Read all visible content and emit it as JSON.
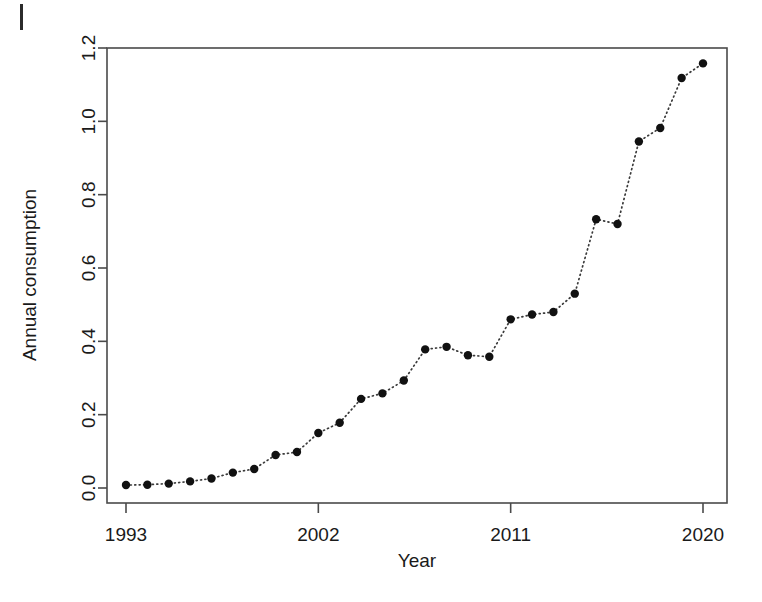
{
  "figure": {
    "background_color": "#ffffff",
    "foreground_color": "#111111",
    "corner_mark": "|"
  },
  "chart_data": {
    "type": "scatter",
    "title": "",
    "xlabel": "Year",
    "ylabel": "Annual consumption",
    "x": [
      1993,
      1994,
      1995,
      1996,
      1997,
      1998,
      1999,
      2000,
      2001,
      2002,
      2003,
      2004,
      2005,
      2006,
      2007,
      2008,
      2009,
      2010,
      2011,
      2012,
      2013,
      2014,
      2015,
      2016,
      2017,
      2018,
      2019,
      2020
    ],
    "values": [
      0.008,
      0.009,
      0.012,
      0.018,
      0.026,
      0.042,
      0.052,
      0.09,
      0.098,
      0.15,
      0.178,
      0.243,
      0.258,
      0.293,
      0.378,
      0.385,
      0.362,
      0.358,
      0.46,
      0.473,
      0.48,
      0.53,
      0.733,
      0.72,
      0.945,
      0.982,
      1.118,
      1.158
    ],
    "xlim": [
      1992.4,
      1920.6
    ],
    "x_range": [
      1992.4,
      2020.6
    ],
    "ylim": [
      -0.04,
      1.24
    ],
    "xticks": [
      1993,
      2002,
      2011,
      2020
    ],
    "xticklabels": [
      "1993",
      "2002",
      "2011",
      "2020"
    ],
    "yticks": [
      0.0,
      0.2,
      0.4,
      0.6,
      0.8,
      1.0,
      1.2
    ],
    "yticklabels": [
      "0.0",
      "0.2",
      "0.4",
      "0.6",
      "0.8",
      "1.0",
      "1.2"
    ],
    "grid": false,
    "legend": null,
    "line_style": "dotted",
    "marker": "filled-circle",
    "marker_color": "#111111",
    "line_color": "#3a3a3a"
  }
}
